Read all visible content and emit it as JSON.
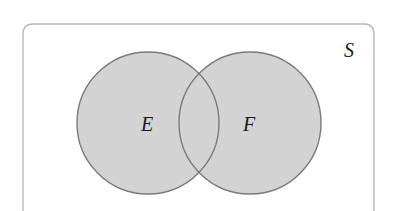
{
  "diagram": {
    "type": "venn",
    "universe": {
      "label": "S",
      "box": {
        "x": 23,
        "y": 24,
        "width": 351,
        "corner_radius": 10
      },
      "stroke": "#b5b5b5",
      "fill": "#ffffff"
    },
    "sets": [
      {
        "label": "E",
        "cx": 148,
        "cy": 123,
        "r": 72,
        "fill": "#d3d3d3",
        "stroke": "#7a7a7a"
      },
      {
        "label": "F",
        "cx": 250,
        "cy": 123,
        "r": 72,
        "fill": "#d3d3d3",
        "stroke": "#7a7a7a"
      }
    ],
    "labels": {
      "universe": "S",
      "set_e": "E",
      "set_f": "F"
    }
  }
}
